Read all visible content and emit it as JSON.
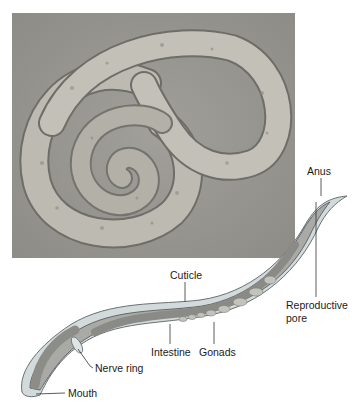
{
  "figure": {
    "photo": {
      "description": "Micrograph of a coiled nematode worm"
    },
    "labels": {
      "anus": "Anus",
      "cuticle": "Cuticle",
      "reproductive_pore_line1": "Reproductive",
      "reproductive_pore_line2": "pore",
      "intestine": "Intestine",
      "gonads": "Gonads",
      "nerve_ring": "Nerve ring",
      "mouth": "Mouth"
    },
    "colors": {
      "photo_bg": "#9a9893",
      "worm_body": "#b9b6ad",
      "cuticle": "#cfd6d8",
      "intestine": "#8f8d88",
      "leader_line": "#333333"
    }
  }
}
